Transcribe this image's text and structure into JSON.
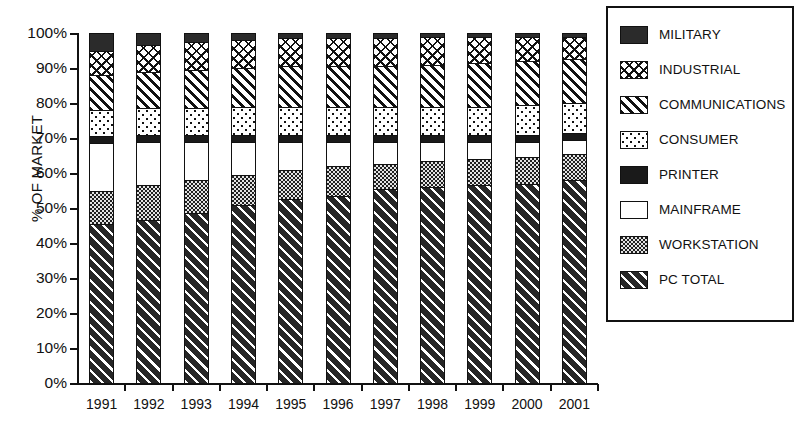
{
  "chart_data": {
    "type": "bar",
    "subtype": "stacked-bar-100-percent",
    "title": "",
    "xlabel": "",
    "ylabel": "% OF MARKET",
    "ylim": [
      0,
      100
    ],
    "yticks": [
      "0%",
      "10%",
      "20%",
      "30%",
      "40%",
      "50%",
      "60%",
      "70%",
      "80%",
      "90%",
      "100%"
    ],
    "ytick_values": [
      0,
      10,
      20,
      30,
      40,
      50,
      60,
      70,
      80,
      90,
      100
    ],
    "grid": false,
    "legend_position": "right",
    "categories": [
      "1991",
      "1992",
      "1993",
      "1994",
      "1995",
      "1996",
      "1997",
      "1998",
      "1999",
      "2000",
      "2001"
    ],
    "stack_order_bottom_to_top": [
      "PC TOTAL",
      "WORKSTATION",
      "MAINFRAME",
      "PRINTER",
      "CONSUMER",
      "COMMUNICATIONS",
      "INDUSTRIAL",
      "MILITARY"
    ],
    "series": [
      {
        "name": "PC TOTAL",
        "pattern": "diagonal-hatch-dark",
        "values": [
          45.5,
          46.5,
          48.5,
          51.0,
          52.5,
          53.5,
          55.5,
          56.0,
          56.5,
          57.0,
          58.0
        ]
      },
      {
        "name": "WORKSTATION",
        "pattern": "fine-dot-gray",
        "values": [
          9.5,
          10.0,
          9.5,
          8.5,
          8.5,
          8.5,
          7.0,
          7.5,
          7.5,
          7.5,
          7.5
        ]
      },
      {
        "name": "MAINFRAME",
        "pattern": "solid-white",
        "values": [
          13.5,
          12.5,
          11.0,
          9.5,
          8.0,
          7.0,
          6.5,
          5.5,
          5.0,
          4.5,
          4.0
        ]
      },
      {
        "name": "PRINTER",
        "pattern": "solid-black",
        "values": [
          2.0,
          2.0,
          2.0,
          2.0,
          2.0,
          2.0,
          2.0,
          2.0,
          2.0,
          2.0,
          2.0
        ]
      },
      {
        "name": "CONSUMER",
        "pattern": "sparse-dot",
        "values": [
          7.5,
          7.5,
          7.5,
          8.0,
          8.0,
          8.0,
          8.0,
          8.0,
          8.0,
          8.5,
          8.5
        ]
      },
      {
        "name": "COMMUNICATIONS",
        "pattern": "diagonal-hatch-light",
        "values": [
          10.0,
          10.5,
          11.0,
          11.0,
          11.5,
          11.5,
          11.5,
          12.0,
          12.5,
          12.5,
          12.5
        ]
      },
      {
        "name": "INDUSTRIAL",
        "pattern": "cross-hatch",
        "values": [
          7.0,
          7.5,
          8.0,
          8.0,
          8.0,
          8.0,
          8.0,
          8.0,
          7.5,
          7.0,
          6.5
        ]
      },
      {
        "name": "MILITARY",
        "pattern": "speckled-black",
        "values": [
          5.0,
          3.5,
          2.5,
          2.0,
          1.5,
          1.5,
          1.5,
          1.0,
          1.0,
          1.0,
          1.0
        ]
      }
    ],
    "cumulative_tops": {
      "PC TOTAL": [
        45.5,
        46.5,
        48.5,
        51.0,
        52.5,
        53.5,
        55.5,
        56.0,
        56.5,
        57.0,
        58.0
      ],
      "WORKSTATION": [
        55.0,
        56.5,
        58.0,
        59.5,
        61.0,
        62.0,
        62.5,
        63.5,
        64.0,
        64.5,
        65.5
      ],
      "MAINFRAME": [
        68.5,
        69.0,
        69.0,
        69.0,
        69.0,
        69.0,
        69.0,
        69.0,
        69.0,
        69.0,
        69.5
      ],
      "PRINTER": [
        70.5,
        71.0,
        71.0,
        71.0,
        71.0,
        71.0,
        71.0,
        71.0,
        71.0,
        71.0,
        71.5
      ],
      "CONSUMER": [
        78.0,
        78.5,
        78.5,
        79.0,
        79.0,
        79.0,
        79.0,
        79.0,
        79.0,
        79.5,
        80.0
      ],
      "COMMUNICATIONS": [
        88.0,
        89.0,
        89.5,
        90.0,
        90.5,
        90.5,
        90.5,
        91.0,
        91.5,
        92.0,
        92.5
      ],
      "INDUSTRIAL": [
        95.0,
        96.5,
        97.5,
        98.0,
        98.5,
        98.5,
        98.5,
        99.0,
        99.0,
        99.0,
        99.0
      ],
      "MILITARY": [
        100,
        100,
        100,
        100,
        100,
        100,
        100,
        100,
        100,
        100,
        100
      ]
    }
  },
  "legend": {
    "items": [
      {
        "label": "MILITARY",
        "pattern": "speckled-black"
      },
      {
        "label": "INDUSTRIAL",
        "pattern": "cross-hatch"
      },
      {
        "label": "COMMUNICATIONS",
        "pattern": "diagonal-hatch-light"
      },
      {
        "label": "CONSUMER",
        "pattern": "sparse-dot"
      },
      {
        "label": "PRINTER",
        "pattern": "solid-black"
      },
      {
        "label": "MAINFRAME",
        "pattern": "solid-white"
      },
      {
        "label": "WORKSTATION",
        "pattern": "fine-dot-gray"
      },
      {
        "label": "PC TOTAL",
        "pattern": "diagonal-hatch-dark"
      }
    ]
  },
  "colors": {
    "ink": "#111111",
    "paper": "#ffffff",
    "black_fill": "#1a1a1a",
    "gray_fill": "#e3e3e3"
  }
}
